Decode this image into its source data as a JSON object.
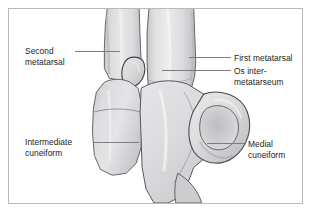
{
  "figure": {
    "type": "anatomical-illustration",
    "frame": {
      "border_color": "#b9b9bb",
      "background_color": "#ffffff"
    },
    "page_background": "#ffffff",
    "palette": {
      "bone_fill_light": "#e3e3e4",
      "bone_fill_mid": "#d2d2d4",
      "bone_fill_shadow": "#b6b6b9",
      "bone_outline": "#4a4a4d",
      "leader_line": "#7d7d80",
      "label_text": "#1b1b1b"
    },
    "labels": [
      {
        "id": "second-metatarsal",
        "lines": [
          "Second",
          "metatarsal"
        ],
        "side": "left",
        "leader": true
      },
      {
        "id": "intermediate-cuneiform",
        "lines": [
          "Intermediate",
          "cuneiform"
        ],
        "side": "left",
        "leader": true
      },
      {
        "id": "first-metatarsal",
        "lines": [
          "First metatarsal"
        ],
        "side": "right",
        "leader": true
      },
      {
        "id": "os-intermetatarseum",
        "lines": [
          "Os inter-",
          "metatarseum"
        ],
        "side": "right",
        "leader": true
      },
      {
        "id": "medial-cuneiform",
        "lines": [
          "Medial",
          "cuneiform"
        ],
        "side": "right",
        "leader": true
      }
    ],
    "label_text": {
      "second_metatarsal": "Second\nmetatarsal",
      "intermediate_cuneiform": "Intermediate\ncuneiform",
      "first_metatarsal": "First metatarsal",
      "os_intermetatarseum": "Os inter-\nmetatarseum",
      "medial_cuneiform": "Medial\ncuneiform"
    },
    "structures": [
      {
        "name": "second-metatarsal",
        "description": "Vertical shaft, left of center, running to the top frame edge"
      },
      {
        "name": "first-metatarsal",
        "description": "Vertical shaft, right of center, broader, running to the top frame edge"
      },
      {
        "name": "os-intermetatarseum",
        "description": "Small accessory ossicle wedged between the bases of the first and second metatarsals"
      },
      {
        "name": "intermediate-cuneiform",
        "description": "Quadrilateral bone at lower left articulating with the second metatarsal base"
      },
      {
        "name": "medial-cuneiform",
        "description": "Large rounded kidney-shaped bone at lower right articulating with the first metatarsal base"
      }
    ]
  }
}
